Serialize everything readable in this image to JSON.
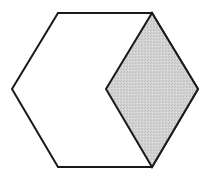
{
  "diagram": {
    "type": "geometric-figure",
    "shape": "regular-hexagon-with-shaded-rhombus",
    "hexagon": {
      "vertices": [
        [
          58,
          13
        ],
        [
          152,
          13
        ],
        [
          198,
          89
        ],
        [
          152,
          167
        ],
        [
          58,
          167
        ],
        [
          12,
          89
        ]
      ],
      "fill": "#ffffff",
      "stroke": "#1a1a1a"
    },
    "rhombus": {
      "vertices": [
        [
          152,
          13
        ],
        [
          198,
          89
        ],
        [
          152,
          167
        ],
        [
          106,
          89
        ]
      ],
      "fill": "#cfcfcf",
      "stroke": "#1a1a1a"
    },
    "stroke_width": 2
  }
}
